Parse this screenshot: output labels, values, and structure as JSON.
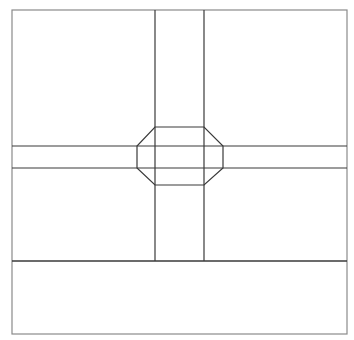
{
  "diagram": {
    "type": "floor-plan-line-drawing",
    "width": 354,
    "height": 340,
    "background": "#ffffff",
    "colors": {
      "outer_border": "#8a8a8a",
      "lines": "#3a3a3a"
    },
    "outer_frame": {
      "x": 12,
      "y": 10,
      "w": 335,
      "h": 324
    },
    "vertical_corridor": {
      "x1": 155,
      "x2": 204,
      "y_top": 10,
      "y_bottom": 261
    },
    "horizontal_corridor": {
      "y1": 146,
      "y2": 168,
      "x_left": 12,
      "x_right": 347
    },
    "bottom_band_divider": {
      "y": 261,
      "x_left": 12,
      "x_right": 347
    },
    "octagon": {
      "points": [
        [
          155,
          127
        ],
        [
          204,
          127
        ],
        [
          223,
          146
        ],
        [
          223,
          168
        ],
        [
          204,
          185
        ],
        [
          155,
          185
        ],
        [
          137,
          168
        ],
        [
          137,
          146
        ]
      ]
    }
  }
}
